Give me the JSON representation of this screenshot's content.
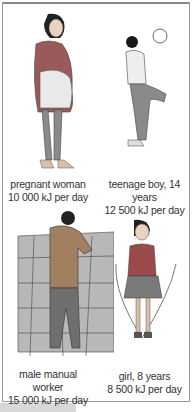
{
  "figures": [
    {
      "name": "pregnant woman",
      "line1": "pregnant woman",
      "line2": "10 000 kJ per day",
      "line3": ""
    },
    {
      "name": "teenage boy",
      "line1": "teenage boy, 14 years",
      "line2": "12 500 kJ per day",
      "line3": ""
    },
    {
      "name": "male manual worker",
      "line1": "male manual",
      "line2": "worker",
      "line3": "15 000 kJ per day"
    },
    {
      "name": "girl",
      "line1": "girl, 8 years",
      "line2": "8 500 kJ per day",
      "line3": ""
    }
  ]
}
